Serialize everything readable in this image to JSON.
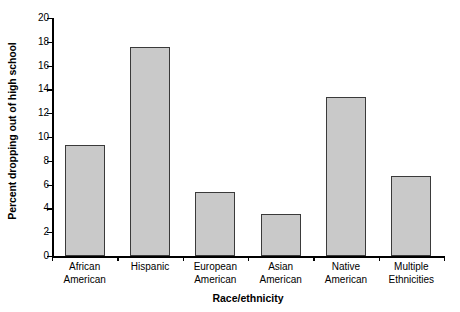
{
  "chart_data": {
    "type": "bar",
    "title": "",
    "subtitle": "",
    "xlabel": "Race/ethnicity",
    "ylabel": "Percent dropping out of high school",
    "categories": [
      "African\nAmerican",
      "Hispanic",
      "European\nAmerican",
      "Asian\nAmerican",
      "Native\nAmerican",
      "Multiple\nEthnicities"
    ],
    "category_lines": [
      [
        "African",
        "American"
      ],
      [
        "Hispanic",
        ""
      ],
      [
        "European",
        "American"
      ],
      [
        "Asian",
        "American"
      ],
      [
        "Native",
        "American"
      ],
      [
        "Multiple",
        "Ethnicities"
      ]
    ],
    "values": [
      9.3,
      17.6,
      5.4,
      3.5,
      13.4,
      6.7
    ],
    "ylim": [
      0,
      20
    ],
    "yticks": [
      0,
      2,
      4,
      6,
      8,
      10,
      12,
      14,
      16,
      18,
      20
    ],
    "ytick_labels": [
      "0",
      "2",
      "4",
      "6",
      "8",
      "10",
      "12",
      "14",
      "16",
      "18",
      "20"
    ],
    "grid": false,
    "legend": false,
    "legend_position": "none",
    "bar_fill_color": "#c9c9c9",
    "bar_edge_color": "#3a3a3a",
    "axis_color": "#000000",
    "background_color": "#ffffff"
  }
}
